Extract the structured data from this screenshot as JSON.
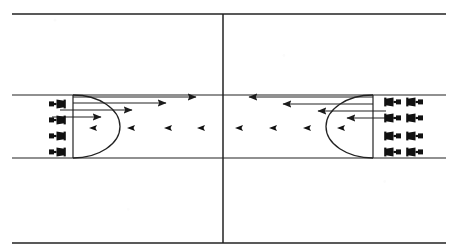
{
  "document": {
    "title": "Opposing Formations Movement Diagram",
    "background_color": "#ffffff",
    "ink_color": "#222222",
    "figure_color": "#111111",
    "width": 458,
    "height": 252
  },
  "frame": {
    "top_line": {
      "label": "top-boundary-line",
      "x1": 12,
      "y1": 14,
      "x2": 446,
      "y2": 14
    },
    "bottom_line": {
      "label": "bottom-boundary-line",
      "x1": 12,
      "y1": 243,
      "x2": 446,
      "y2": 243
    },
    "center_line": {
      "label": "center-divider-line",
      "x": 223,
      "y1": 14,
      "y2": 243
    }
  },
  "lane": {
    "label": "corridor",
    "top_line": {
      "x1": 12,
      "y": 95,
      "x2": 446
    },
    "bottom_line": {
      "x1": 12,
      "y": 158,
      "x2": 446
    }
  },
  "left_group": {
    "label": "left-formation",
    "arc": {
      "label": "left-arc",
      "cx": 73,
      "cy": 126.5,
      "rx": 47,
      "ry": 31.5,
      "bulge": "right"
    },
    "post": {
      "label": "left-vertical-post",
      "x": 73,
      "y1": 95,
      "y2": 158
    },
    "figures": [
      {
        "id": 1,
        "x": 58,
        "y": 104,
        "facing": "right"
      },
      {
        "id": 2,
        "x": 58,
        "y": 120,
        "facing": "right"
      },
      {
        "id": 3,
        "x": 58,
        "y": 136,
        "facing": "right"
      },
      {
        "id": 4,
        "x": 58,
        "y": 152,
        "facing": "right"
      }
    ],
    "arrows": [
      {
        "id": "a1",
        "direction": "right",
        "x_start": 73,
        "x_end": 196,
        "y": 97
      },
      {
        "id": "a2",
        "direction": "right",
        "x_start": 73,
        "x_end": 166,
        "y": 103
      },
      {
        "id": "a3",
        "direction": "right",
        "x_start": 60,
        "x_end": 132,
        "y": 110
      },
      {
        "id": "a4",
        "direction": "right",
        "x_start": 52,
        "x_end": 101,
        "y": 117
      }
    ],
    "trail_markers": {
      "direction": "left",
      "y": 128,
      "x_positions": [
        97,
        135,
        172,
        205
      ]
    }
  },
  "right_group": {
    "label": "right-formation",
    "arc": {
      "label": "right-arc",
      "cx": 373,
      "cy": 126.5,
      "rx": 47,
      "ry": 31.5,
      "bulge": "left"
    },
    "post": {
      "label": "right-vertical-post",
      "x": 373,
      "y1": 95,
      "y2": 158
    },
    "figure_rows": [
      {
        "row": 1,
        "y": 102,
        "x_positions": [
          392,
          414
        ]
      },
      {
        "row": 2,
        "y": 118,
        "x_positions": [
          392,
          414
        ]
      },
      {
        "row": 3,
        "y": 136,
        "x_positions": [
          392,
          414
        ]
      },
      {
        "row": 4,
        "y": 152,
        "x_positions": [
          392,
          414
        ]
      }
    ],
    "arrows": [
      {
        "id": "b1",
        "direction": "left",
        "x_start": 373,
        "x_end": 249,
        "y": 97
      },
      {
        "id": "b2",
        "direction": "left",
        "x_start": 373,
        "x_end": 283,
        "y": 104
      },
      {
        "id": "b3",
        "direction": "left",
        "x_start": 386,
        "x_end": 318,
        "y": 111
      },
      {
        "id": "b4",
        "direction": "left",
        "x_start": 394,
        "x_end": 347,
        "y": 118
      }
    ],
    "trail_markers": {
      "direction": "left",
      "y": 128,
      "x_positions": [
        243,
        277,
        311,
        345
      ]
    }
  }
}
